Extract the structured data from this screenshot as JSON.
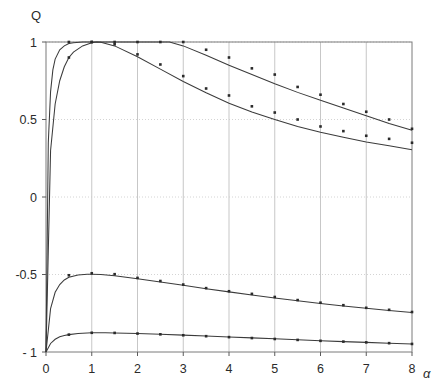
{
  "chart_data": {
    "type": "line",
    "title": "",
    "xlabel": "α",
    "ylabel": "Q",
    "xlim": [
      0,
      8
    ],
    "ylim": [
      -1,
      1
    ],
    "xticks": [
      0,
      1,
      2,
      3,
      4,
      5,
      6,
      7,
      8
    ],
    "xticklabels": [
      "0",
      "1",
      "2",
      "3",
      "4",
      "5",
      "6",
      "7",
      "8"
    ],
    "yticks": [
      -1,
      -0.5,
      0,
      0.5,
      1
    ],
    "yticklabels": [
      "- 1",
      "-0.5",
      "0",
      "0.5",
      "1"
    ],
    "grid": true,
    "grid_style": "dotted",
    "legend": "none",
    "marker": "square-dot",
    "series": [
      {
        "name": "curve-1-upper-plateau",
        "style": "line+markers",
        "x": [
          0.0,
          0.05,
          0.1,
          0.15,
          0.2,
          0.3,
          0.4,
          0.5,
          0.6,
          0.8,
          1.0,
          1.2,
          1.5,
          2.0,
          2.5,
          2.7,
          3.0,
          3.5,
          4.0,
          4.5,
          5.0,
          5.5,
          6.0,
          6.5,
          7.0,
          7.5,
          8.0
        ],
        "y": [
          -1.0,
          0.35,
          0.68,
          0.82,
          0.89,
          0.95,
          0.975,
          0.99,
          0.995,
          1.0,
          1.0,
          1.0,
          1.0,
          1.0,
          1.0,
          1.0,
          0.975,
          0.915,
          0.85,
          0.79,
          0.73,
          0.675,
          0.625,
          0.575,
          0.525,
          0.475,
          0.43
        ],
        "markers_x": [
          0.5,
          1.0,
          1.5,
          2.0,
          2.5,
          3.0,
          3.5,
          4.0,
          4.5,
          5.0,
          5.5,
          6.0,
          6.5,
          7.0,
          7.5,
          8.0
        ],
        "markers_y": [
          1.0,
          1.0,
          1.0,
          1.0,
          1.0,
          1.0,
          0.95,
          0.9,
          0.83,
          0.79,
          0.71,
          0.66,
          0.6,
          0.55,
          0.5,
          0.44
        ]
      },
      {
        "name": "curve-2-upper-peak",
        "style": "line+markers",
        "x": [
          0.0,
          0.1,
          0.2,
          0.3,
          0.4,
          0.5,
          0.6,
          0.8,
          1.0,
          1.1,
          1.2,
          1.5,
          2.0,
          2.5,
          3.0,
          3.5,
          4.0,
          4.5,
          5.0,
          5.5,
          6.0,
          6.5,
          7.0,
          7.5,
          8.0
        ],
        "y": [
          -1.0,
          0.3,
          0.6,
          0.75,
          0.84,
          0.9,
          0.935,
          0.975,
          0.995,
          1.0,
          0.998,
          0.975,
          0.905,
          0.825,
          0.745,
          0.672,
          0.605,
          0.548,
          0.5,
          0.455,
          0.418,
          0.385,
          0.355,
          0.33,
          0.305
        ],
        "markers_x": [
          0.5,
          1.0,
          1.5,
          2.0,
          2.5,
          3.0,
          3.5,
          4.0,
          4.5,
          5.0,
          5.5,
          6.0,
          6.5,
          7.0,
          7.5,
          8.0
        ],
        "markers_y": [
          0.9,
          1.0,
          0.985,
          0.92,
          0.855,
          0.78,
          0.7,
          0.655,
          0.585,
          0.545,
          0.5,
          0.455,
          0.425,
          0.395,
          0.375,
          0.35
        ]
      },
      {
        "name": "curve-3-lower-peak",
        "style": "line+markers",
        "x": [
          0.0,
          0.1,
          0.2,
          0.3,
          0.4,
          0.5,
          0.7,
          0.9,
          1.0,
          1.2,
          1.5,
          2.0,
          2.5,
          3.0,
          3.5,
          4.0,
          4.5,
          5.0,
          5.5,
          6.0,
          6.5,
          7.0,
          7.5,
          8.0
        ],
        "y": [
          -1.0,
          -0.72,
          -0.615,
          -0.565,
          -0.535,
          -0.518,
          -0.503,
          -0.499,
          -0.498,
          -0.5,
          -0.508,
          -0.527,
          -0.548,
          -0.57,
          -0.592,
          -0.612,
          -0.632,
          -0.652,
          -0.67,
          -0.687,
          -0.703,
          -0.718,
          -0.732,
          -0.745
        ],
        "markers_x": [
          0.5,
          1.0,
          1.5,
          2.0,
          2.5,
          3.0,
          3.5,
          4.0,
          4.5,
          5.0,
          5.5,
          6.0,
          6.5,
          7.0,
          7.5,
          8.0
        ],
        "markers_y": [
          -0.505,
          -0.492,
          -0.498,
          -0.522,
          -0.542,
          -0.565,
          -0.588,
          -0.608,
          -0.625,
          -0.645,
          -0.665,
          -0.682,
          -0.698,
          -0.715,
          -0.728,
          -0.742
        ]
      },
      {
        "name": "curve-4-lower-flat",
        "style": "line+markers",
        "x": [
          0.0,
          0.1,
          0.2,
          0.3,
          0.4,
          0.5,
          0.7,
          1.0,
          1.3,
          1.5,
          2.0,
          2.5,
          3.0,
          3.5,
          4.0,
          4.5,
          5.0,
          5.5,
          6.0,
          6.5,
          7.0,
          7.5,
          8.0
        ],
        "y": [
          -1.0,
          -0.945,
          -0.918,
          -0.902,
          -0.893,
          -0.888,
          -0.88,
          -0.876,
          -0.876,
          -0.877,
          -0.88,
          -0.885,
          -0.891,
          -0.897,
          -0.903,
          -0.909,
          -0.915,
          -0.921,
          -0.927,
          -0.933,
          -0.938,
          -0.943,
          -0.948
        ],
        "markers_x": [
          0.5,
          1.0,
          1.5,
          2.0,
          2.5,
          3.0,
          3.5,
          4.0,
          4.5,
          5.0,
          5.5,
          6.0,
          6.5,
          7.0,
          7.5,
          8.0
        ],
        "markers_y": [
          -0.888,
          -0.876,
          -0.877,
          -0.881,
          -0.886,
          -0.892,
          -0.898,
          -0.904,
          -0.91,
          -0.916,
          -0.922,
          -0.928,
          -0.933,
          -0.938,
          -0.943,
          -0.948
        ]
      }
    ]
  },
  "axes": {
    "y_axis_title": "Q",
    "x_axis_title": "α"
  }
}
